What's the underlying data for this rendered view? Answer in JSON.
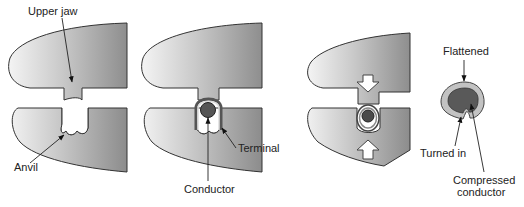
{
  "diagram": {
    "stages": [
      {
        "id": "stage-1",
        "description": "Open die: upper jaw above anvil"
      },
      {
        "id": "stage-2",
        "description": "Terminal with conductor placed in anvil"
      },
      {
        "id": "stage-3",
        "description": "Die closing, compressing terminal"
      },
      {
        "id": "stage-4",
        "description": "Finished crimp cross-section"
      }
    ],
    "labels": {
      "upper_jaw": "Upper jaw",
      "anvil": "Anvil",
      "terminal": "Terminal",
      "conductor": "Conductor",
      "flattened": "Flattened",
      "turned_in": "Turned in",
      "compressed_line1": "Compressed",
      "compressed_line2": "conductor"
    },
    "colors": {
      "jaw_dark": "#8f8f8f",
      "jaw_light": "#f2f2f2",
      "conductor": "#555555",
      "terminal_ring": "#bdbdbd",
      "arrow_fill": "#ffffff",
      "text": "#222222"
    }
  }
}
